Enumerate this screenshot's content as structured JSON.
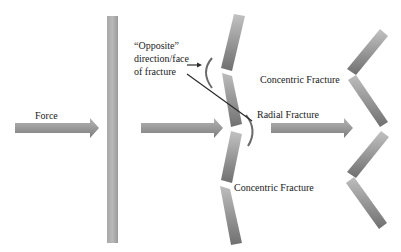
{
  "diagram": {
    "type": "glass-fracture-process",
    "labels": {
      "force": "Force",
      "opposite_line1": "“Opposite”",
      "opposite_line2": "direction/face",
      "opposite_line3": "of fracture",
      "radial_fracture": "Radial Fracture",
      "concentric_fracture_top": "Concentric Fracture",
      "concentric_fracture_bottom": "Concentric Fracture"
    },
    "stages": [
      {
        "name": "force-applied",
        "description": "Straight pane with force arrow"
      },
      {
        "name": "radial-fracture",
        "description": "Pane bends away, radial fracture forms on opposite face"
      },
      {
        "name": "concentric-fracture",
        "description": "Pane breaks into zig-zag with concentric fractures"
      }
    ],
    "colors": {
      "pane_light": "#c4c4c4",
      "pane_dark": "#6e6e6e",
      "arrow_light": "#b8b8b8",
      "arrow_dark": "#7a7a7a",
      "leader_line": "#2b2b2b",
      "text": "#1a1a1a"
    }
  }
}
